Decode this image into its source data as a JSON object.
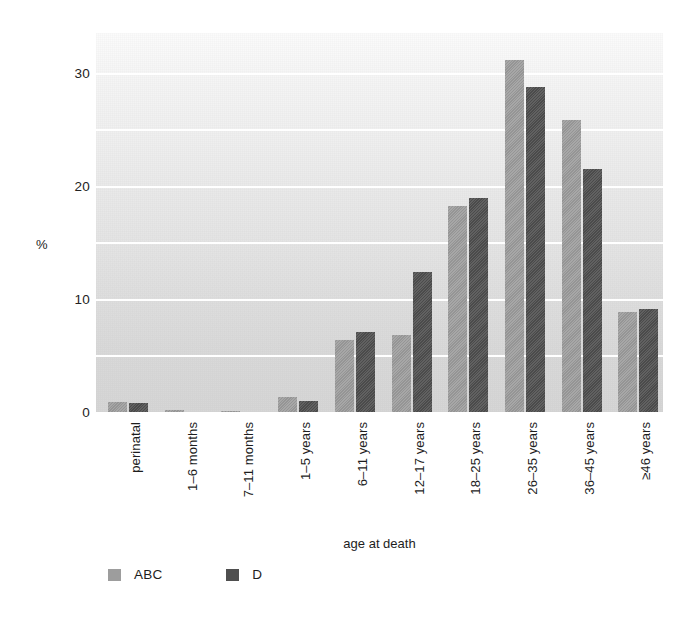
{
  "chart_data": {
    "type": "bar",
    "title": "",
    "xlabel": "age at death",
    "ylabel": "%",
    "ylim": [
      0,
      33.5
    ],
    "yticks": [
      0,
      10,
      20,
      30
    ],
    "ytick_labels": [
      "0",
      "10",
      "20",
      "30"
    ],
    "gridlines": [
      5,
      10,
      15,
      20,
      25,
      30
    ],
    "grid": true,
    "grid_color": "#ffffff",
    "legend_position": "bottom-left",
    "categories": [
      "perinatal",
      "1–6 months",
      "7–11 months",
      "1–5 years",
      "6–11 years",
      "12–17 years",
      "18–25 years",
      "26–35 years",
      "36–45 years",
      "≥46 years"
    ],
    "series": [
      {
        "name": "ABC",
        "color": "#9d9d9d",
        "values": [
          0.9,
          0.15,
          0.1,
          1.3,
          6.4,
          6.8,
          18.2,
          31.1,
          25.8,
          8.8
        ]
      },
      {
        "name": "D",
        "color": "#4f4f4f",
        "values": [
          0.8,
          0.0,
          0.0,
          1.0,
          7.1,
          12.4,
          18.9,
          28.7,
          21.5,
          9.1
        ]
      }
    ]
  },
  "legend": {
    "items": [
      {
        "label": "ABC",
        "color": "#9d9d9d"
      },
      {
        "label": "D",
        "color": "#4f4f4f"
      }
    ]
  }
}
